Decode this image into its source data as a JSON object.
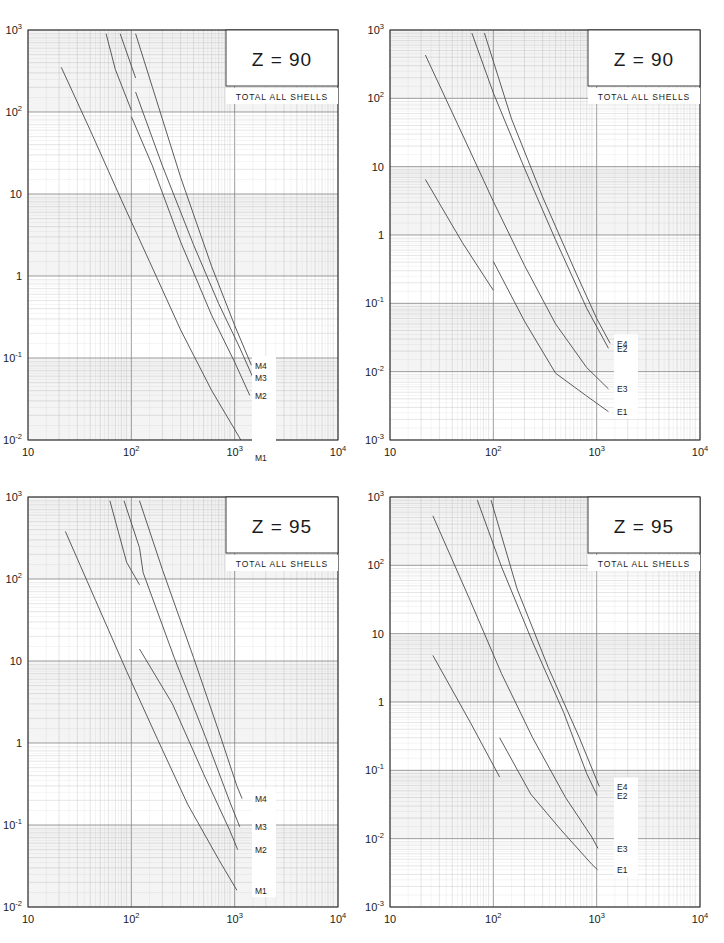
{
  "figure": {
    "width": 724,
    "height": 943,
    "background": "#ffffff",
    "panel_count": 4,
    "layout": "2x2 grid of log-log plots"
  },
  "chart_data": [
    {
      "id": "top-left",
      "type": "line",
      "title": "Z = 90",
      "subtitle": "TOTAL ALL SHELLS",
      "xlabel": "",
      "ylabel": "",
      "xscale": "log",
      "yscale": "log",
      "xlim": [
        10,
        10000
      ],
      "ylim": [
        0.01,
        1000
      ],
      "xticks": [
        "10",
        "10^2",
        "10^3",
        "10^4"
      ],
      "yticks": [
        "10^3",
        "10^2",
        "10",
        "1",
        "10^-1",
        "10^-2"
      ],
      "grid": true,
      "legend_position": "inside-bottom-right",
      "series": [
        {
          "name": "M1",
          "points": [
            [
              21,
              350
            ],
            [
              40,
              60
            ],
            [
              80,
              8.5
            ],
            [
              150,
              1.5
            ],
            [
              300,
              0.22
            ],
            [
              600,
              0.04
            ],
            [
              1100,
              0.011
            ],
            [
              1400,
              0.0062
            ]
          ]
        },
        {
          "name": "M2",
          "points": [
            [
              57,
              900
            ],
            [
              70,
              330
            ],
            [
              100,
              105
            ],
            [
              100,
              88
            ],
            [
              160,
              22
            ],
            [
              300,
              2.6
            ],
            [
              600,
              0.33
            ],
            [
              1000,
              0.089
            ],
            [
              1400,
              0.035
            ]
          ]
        },
        {
          "name": "M3",
          "points": [
            [
              78,
              900
            ],
            [
              110,
              260
            ],
            [
              110,
              175
            ],
            [
              200,
              22
            ],
            [
              400,
              2.4
            ],
            [
              700,
              0.46
            ],
            [
              1100,
              0.14
            ],
            [
              1500,
              0.058
            ]
          ]
        },
        {
          "name": "M4",
          "points": [
            [
              110,
              900
            ],
            [
              160,
              200
            ],
            [
              300,
              16
            ],
            [
              600,
              1.3
            ],
            [
              1000,
              0.25
            ],
            [
              1450,
              0.082
            ]
          ]
        }
      ]
    },
    {
      "id": "top-right",
      "type": "line",
      "title": "Z = 90",
      "subtitle": "TOTAL ALL SHELLS",
      "xlabel": "",
      "ylabel": "",
      "xscale": "log",
      "yscale": "log",
      "xlim": [
        10,
        10000
      ],
      "ylim": [
        0.001,
        1000
      ],
      "xticks": [
        "10",
        "10^2",
        "10^3",
        "10^4"
      ],
      "yticks": [
        "10^3",
        "10^2",
        "10",
        "1",
        "10^-1",
        "10^-2",
        "10^-3"
      ],
      "grid": true,
      "legend_position": "inside-bottom-right",
      "series": [
        {
          "name": "E1",
          "points": [
            [
              22,
              6.5
            ],
            [
              50,
              0.78
            ],
            [
              100,
              0.155
            ],
            [
              100,
              0.41
            ],
            [
              200,
              0.055
            ],
            [
              400,
              0.0095
            ],
            [
              800,
              0.0044
            ],
            [
              1300,
              0.0026
            ]
          ]
        },
        {
          "name": "E2",
          "points": [
            [
              62,
              900
            ],
            [
              100,
              120
            ],
            [
              200,
              9.5
            ],
            [
              400,
              0.85
            ],
            [
              800,
              0.085
            ],
            [
              1300,
              0.022
            ]
          ]
        },
        {
          "name": "E3",
          "points": [
            [
              22,
              430
            ],
            [
              50,
              30
            ],
            [
              100,
              3.1
            ],
            [
              200,
              0.36
            ],
            [
              400,
              0.05
            ],
            [
              800,
              0.0115
            ],
            [
              1300,
              0.0056
            ]
          ]
        },
        {
          "name": "E4",
          "points": [
            [
              82,
              900
            ],
            [
              150,
              50
            ],
            [
              300,
              3.6
            ],
            [
              600,
              0.33
            ],
            [
              1000,
              0.06
            ],
            [
              1350,
              0.026
            ]
          ]
        }
      ]
    },
    {
      "id": "bottom-left",
      "type": "line",
      "title": "Z = 95",
      "subtitle": "TOTAL ALL SHELLS",
      "xlabel": "",
      "ylabel": "",
      "xscale": "log",
      "yscale": "log",
      "xlim": [
        10,
        10000
      ],
      "ylim": [
        0.01,
        1000
      ],
      "xticks": [
        "10",
        "10^2",
        "10^3",
        "10^4"
      ],
      "yticks": [
        "10^3",
        "10^2",
        "10",
        "1",
        "10^-1",
        "10^-2"
      ],
      "grid": true,
      "legend_position": "inside-bottom-right",
      "series": [
        {
          "name": "M1",
          "points": [
            [
              23,
              380
            ],
            [
              45,
              55
            ],
            [
              90,
              7.5
            ],
            [
              180,
              1.1
            ],
            [
              350,
              0.18
            ],
            [
              700,
              0.038
            ],
            [
              1050,
              0.016
            ]
          ]
        },
        {
          "name": "M2",
          "points": [
            [
              62,
              900
            ],
            [
              90,
              160
            ],
            [
              120,
              85
            ],
            [
              120,
              14
            ],
            [
              250,
              3.0
            ],
            [
              500,
              0.42
            ],
            [
              900,
              0.085
            ],
            [
              1070,
              0.05
            ]
          ]
        },
        {
          "name": "M3",
          "points": [
            [
              85,
              900
            ],
            [
              120,
              240
            ],
            [
              130,
              120
            ],
            [
              260,
              11
            ],
            [
              520,
              1.2
            ],
            [
              900,
              0.19
            ],
            [
              1120,
              0.095
            ]
          ]
        },
        {
          "name": "M4",
          "points": [
            [
              120,
              900
            ],
            [
              200,
              130
            ],
            [
              400,
              11
            ],
            [
              700,
              1.4
            ],
            [
              1050,
              0.3
            ],
            [
              1180,
              0.21
            ]
          ]
        }
      ]
    },
    {
      "id": "bottom-right",
      "type": "line",
      "title": "Z = 95",
      "subtitle": "TOTAL ALL SHELLS",
      "xlabel": "",
      "ylabel": "",
      "xscale": "log",
      "yscale": "log",
      "xlim": [
        10,
        10000
      ],
      "ylim": [
        0.001,
        1000
      ],
      "xticks": [
        "10",
        "10^2",
        "10^3",
        "10^4"
      ],
      "yticks": [
        "10^3",
        "10^2",
        "10",
        "1",
        "10^-1",
        "10^-2",
        "10^-3"
      ],
      "grid": true,
      "legend_position": "inside-bottom-right",
      "series": [
        {
          "name": "E1",
          "points": [
            [
              26,
              4.8
            ],
            [
              60,
              0.5
            ],
            [
              115,
              0.08
            ],
            [
              115,
              0.3
            ],
            [
              230,
              0.045
            ],
            [
              450,
              0.0135
            ],
            [
              900,
              0.0042
            ],
            [
              1020,
              0.0035
            ]
          ]
        },
        {
          "name": "E2",
          "points": [
            [
              70,
              900
            ],
            [
              120,
              95
            ],
            [
              240,
              7.5
            ],
            [
              480,
              0.7
            ],
            [
              800,
              0.09
            ],
            [
              1010,
              0.043
            ]
          ]
        },
        {
          "name": "E3",
          "points": [
            [
              26,
              530
            ],
            [
              60,
              30
            ],
            [
              120,
              2.6
            ],
            [
              240,
              0.3
            ],
            [
              500,
              0.04
            ],
            [
              900,
              0.0105
            ],
            [
              1030,
              0.0072
            ]
          ]
        },
        {
          "name": "E4",
          "points": [
            [
              95,
              900
            ],
            [
              170,
              45
            ],
            [
              340,
              3.2
            ],
            [
              680,
              0.3
            ],
            [
              1000,
              0.072
            ],
            [
              1060,
              0.058
            ]
          ]
        }
      ]
    }
  ],
  "panels": [
    {
      "title": "Z = 90",
      "subtitle": "TOTAL ALL SHELLS",
      "xticks": [
        "10",
        "10",
        "10",
        "10"
      ],
      "xtick_sups": [
        "",
        "2",
        "3",
        "4"
      ],
      "yticks": [
        "10",
        "10",
        "10",
        "1",
        "10",
        "10"
      ],
      "ytick_sups": [
        "3",
        "2",
        "",
        "",
        "-1",
        "-2"
      ],
      "curve_labels": [
        "M4",
        "M3",
        "M2",
        "M1"
      ]
    },
    {
      "title": "Z = 90",
      "subtitle": "TOTAL ALL SHELLS",
      "xticks": [
        "10",
        "10",
        "10",
        "10"
      ],
      "xtick_sups": [
        "",
        "2",
        "3",
        "4"
      ],
      "yticks": [
        "10",
        "10",
        "10",
        "1",
        "10",
        "10",
        "10"
      ],
      "ytick_sups": [
        "3",
        "2",
        "",
        "",
        "-1",
        "-2",
        "-3"
      ],
      "curve_labels": [
        "E4",
        "E3",
        "E2",
        "E1"
      ]
    },
    {
      "title": "Z = 95",
      "subtitle": "TOTAL ALL SHELLS",
      "xticks": [
        "10",
        "10",
        "10",
        "10"
      ],
      "xtick_sups": [
        "",
        "2",
        "3",
        "4"
      ],
      "yticks": [
        "10",
        "10",
        "10",
        "1",
        "10",
        "10"
      ],
      "ytick_sups": [
        "3",
        "2",
        "",
        "",
        "-1",
        "-2"
      ],
      "curve_labels": [
        "M4",
        "M3",
        "M2",
        "M1"
      ]
    },
    {
      "title": "Z = 95",
      "subtitle": "TOTAL ALL SHELLS",
      "xticks": [
        "10",
        "10",
        "10",
        "10"
      ],
      "xtick_sups": [
        "",
        "2",
        "3",
        "4"
      ],
      "yticks": [
        "10",
        "10",
        "10",
        "1",
        "10",
        "10",
        "10"
      ],
      "ytick_sups": [
        "3",
        "2",
        "",
        "",
        "-1",
        "-2",
        "-3"
      ],
      "curve_labels": [
        "E4",
        "E3",
        "E2",
        "E1"
      ]
    }
  ],
  "colors": {
    "frame": "#2b2b2b",
    "curve": "#4a4a4a",
    "grid_major": "#8c8c8c",
    "grid_minor": "#bfbfbf",
    "text": "#1a1a1a",
    "background": "#ffffff"
  }
}
